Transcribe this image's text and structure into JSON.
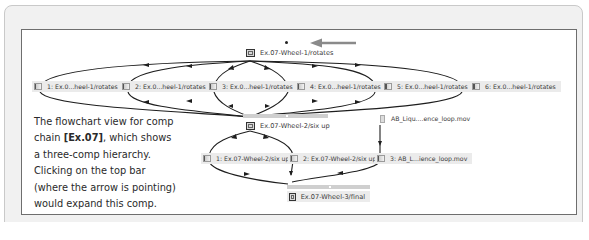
{
  "diagram": {
    "top_node": {
      "label": "Ex.07-Wheel-1/rotates",
      "icon": "comp-icon"
    },
    "pointer_arrow": {
      "direction": "left",
      "color": "#8a8a8a"
    },
    "layer_row_1": [
      {
        "label": "1: Ex.0...heel-1/rotates",
        "icon": "layer-icon"
      },
      {
        "label": "2: Ex.0...heel-1/rotates",
        "icon": "layer-icon"
      },
      {
        "label": "3: Ex.0...heel-1/rotates",
        "icon": "layer-icon"
      },
      {
        "label": "4: Ex.0...heel-1/rotates",
        "icon": "layer-icon"
      },
      {
        "label": "5: Ex.0...heel-1/rotates",
        "icon": "layer-icon"
      },
      {
        "label": "6: Ex.0...heel-1/rotates",
        "icon": "layer-icon"
      }
    ],
    "middle_node": {
      "label": "Ex.07-Wheel-2/six up",
      "icon": "comp-icon"
    },
    "footage_node": {
      "label": "AB_Liqu....ence_loop.mov",
      "icon": "footage-icon"
    },
    "layer_row_2": [
      {
        "label": "1: Ex.07-Wheel-2/six up",
        "icon": "layer-icon"
      },
      {
        "label": "2: Ex.07-Wheel-2/six up",
        "icon": "layer-icon"
      },
      {
        "label": "3: AB_L...ience_loop.mov",
        "icon": "layer-icon"
      }
    ],
    "bottom_node": {
      "label": "Ex.07-Wheel-3/final",
      "icon": "comp-icon"
    },
    "edge_color": "#1e1e1e"
  },
  "caption": {
    "line1": "The flowchart view for comp",
    "line2_pre": "chain ",
    "line2_bold": "[Ex.07]",
    "line2_post": ", which shows",
    "line3": "a three-comp hierarchy.",
    "line4": "Clicking on the top bar",
    "line5": "(where the arrow is pointing)",
    "line6": "would expand this comp."
  }
}
